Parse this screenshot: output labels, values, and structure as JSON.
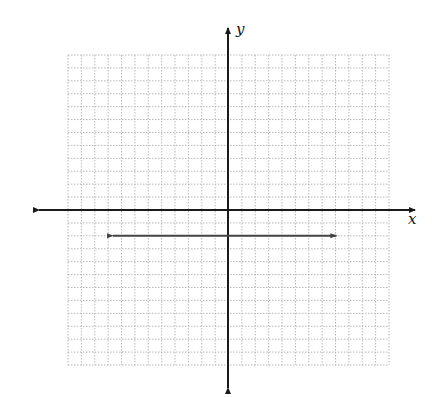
{
  "diagram": {
    "type": "coordinate-plane",
    "background": "#ffffff",
    "grid": {
      "left_px": 68,
      "top_px": 55,
      "right_px": 389,
      "bottom_px": 365,
      "cols": 24,
      "rows": 24,
      "x_range": [
        -12,
        12
      ],
      "y_range": [
        -12,
        12
      ],
      "color": "#b8b8b8",
      "style": "dotted"
    },
    "axes": {
      "color": "#1a1a1a",
      "origin_px": [
        228,
        210
      ],
      "x_axis": {
        "from_px": 39,
        "to_px": 415,
        "label": "x"
      },
      "y_axis": {
        "from_px": 28,
        "to_px": 388,
        "label": "y"
      }
    },
    "lines": [
      {
        "name": "horizontal-line",
        "equation": "y = -2",
        "y": -2,
        "x_from": -8.6,
        "x_to": 8.1,
        "arrows": "both",
        "color": "#444444"
      }
    ]
  },
  "labels": {
    "x_axis_label": "x",
    "y_axis_label": "y"
  }
}
